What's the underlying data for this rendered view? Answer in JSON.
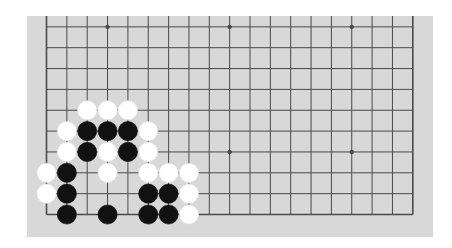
{
  "board": {
    "size": 19,
    "visible_rows_from_bottom": 10,
    "orientation": "bottom portion of 19x19 board shown; top edge cropped",
    "colors": {
      "background": "#ffffff",
      "board": "#d8d8d8",
      "line": "#4a4a4a",
      "black_stone": "#111111",
      "white_stone": "#ffffff"
    },
    "star_points": [
      {
        "col": 3,
        "row": 10
      },
      {
        "col": 9,
        "row": 10
      },
      {
        "col": 15,
        "row": 10
      },
      {
        "col": 3,
        "row": 4
      },
      {
        "col": 9,
        "row": 4
      },
      {
        "col": 15,
        "row": 4
      }
    ],
    "stones": [
      {
        "color": "white",
        "col": 2,
        "row": 6
      },
      {
        "color": "white",
        "col": 3,
        "row": 6
      },
      {
        "color": "white",
        "col": 4,
        "row": 6
      },
      {
        "color": "white",
        "col": 1,
        "row": 5
      },
      {
        "color": "black",
        "col": 2,
        "row": 5
      },
      {
        "color": "black",
        "col": 3,
        "row": 5
      },
      {
        "color": "black",
        "col": 4,
        "row": 5
      },
      {
        "color": "white",
        "col": 5,
        "row": 5
      },
      {
        "color": "white",
        "col": 1,
        "row": 4
      },
      {
        "color": "black",
        "col": 2,
        "row": 4
      },
      {
        "color": "white",
        "col": 3,
        "row": 4
      },
      {
        "color": "black",
        "col": 4,
        "row": 4
      },
      {
        "color": "white",
        "col": 5,
        "row": 4
      },
      {
        "color": "white",
        "col": 0,
        "row": 3
      },
      {
        "color": "black",
        "col": 1,
        "row": 3
      },
      {
        "color": "white",
        "col": 3,
        "row": 3
      },
      {
        "color": "white",
        "col": 5,
        "row": 3
      },
      {
        "color": "white",
        "col": 6,
        "row": 3
      },
      {
        "color": "white",
        "col": 7,
        "row": 3
      },
      {
        "color": "white",
        "col": 0,
        "row": 2
      },
      {
        "color": "black",
        "col": 1,
        "row": 2
      },
      {
        "color": "black",
        "col": 5,
        "row": 2
      },
      {
        "color": "black",
        "col": 6,
        "row": 2
      },
      {
        "color": "white",
        "col": 7,
        "row": 2
      },
      {
        "color": "black",
        "col": 1,
        "row": 1
      },
      {
        "color": "black",
        "col": 3,
        "row": 1
      },
      {
        "color": "black",
        "col": 5,
        "row": 1
      },
      {
        "color": "black",
        "col": 6,
        "row": 1
      },
      {
        "color": "white",
        "col": 7,
        "row": 1
      }
    ]
  }
}
